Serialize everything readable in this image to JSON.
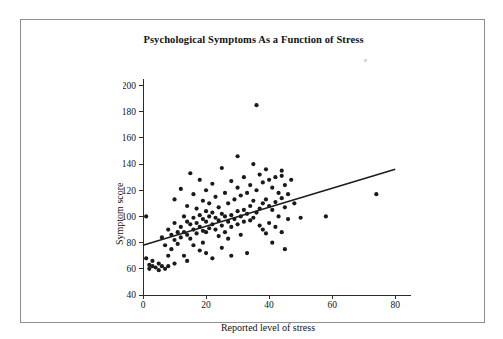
{
  "chart_data": {
    "type": "scatter",
    "title": "Psychological Symptoms As a Function of Stress",
    "xlabel": "Reported level of stress",
    "ylabel": "Symptom score",
    "xlim": [
      0,
      85
    ],
    "ylim": [
      40,
      205
    ],
    "xticks": [
      0,
      20,
      40,
      60,
      80
    ],
    "yticks": [
      40,
      60,
      80,
      100,
      120,
      140,
      160,
      180,
      200
    ],
    "xtick_labels": [
      "0",
      "20",
      "40",
      "60",
      "80"
    ],
    "ytick_labels": [
      "40",
      "60",
      "80",
      "100",
      "120",
      "140",
      "160",
      "180",
      "200"
    ],
    "grid": false,
    "legend": null,
    "marker": "filled-circle",
    "marker_color": "#1a1a1a",
    "trendline": {
      "type": "linear-regression",
      "color": "#1d1d1d",
      "x_start": 0,
      "y_start": 78,
      "x_end": 80,
      "y_end": 136
    },
    "points": [
      [
        1,
        100
      ],
      [
        1,
        68
      ],
      [
        2,
        63
      ],
      [
        2,
        60
      ],
      [
        3,
        66
      ],
      [
        3,
        62
      ],
      [
        4,
        61
      ],
      [
        5,
        64
      ],
      [
        5,
        59
      ],
      [
        6,
        62
      ],
      [
        6,
        84
      ],
      [
        7,
        78
      ],
      [
        7,
        60
      ],
      [
        8,
        90
      ],
      [
        8,
        70
      ],
      [
        8,
        62
      ],
      [
        9,
        86
      ],
      [
        9,
        75
      ],
      [
        10,
        113
      ],
      [
        10,
        95
      ],
      [
        10,
        82
      ],
      [
        10,
        64
      ],
      [
        11,
        88
      ],
      [
        11,
        79
      ],
      [
        12,
        121
      ],
      [
        12,
        92
      ],
      [
        12,
        84
      ],
      [
        13,
        100
      ],
      [
        13,
        88
      ],
      [
        13,
        70
      ],
      [
        14,
        108
      ],
      [
        14,
        96
      ],
      [
        14,
        86
      ],
      [
        14,
        66
      ],
      [
        15,
        133
      ],
      [
        15,
        94
      ],
      [
        15,
        83
      ],
      [
        16,
        117
      ],
      [
        16,
        99
      ],
      [
        16,
        90
      ],
      [
        16,
        78
      ],
      [
        17,
        106
      ],
      [
        17,
        95
      ],
      [
        17,
        87
      ],
      [
        18,
        128
      ],
      [
        18,
        101
      ],
      [
        18,
        92
      ],
      [
        18,
        74
      ],
      [
        19,
        112
      ],
      [
        19,
        98
      ],
      [
        19,
        89
      ],
      [
        19,
        80
      ],
      [
        20,
        120
      ],
      [
        20,
        104
      ],
      [
        20,
        96
      ],
      [
        20,
        88
      ],
      [
        20,
        72
      ],
      [
        21,
        110
      ],
      [
        21,
        100
      ],
      [
        21,
        91
      ],
      [
        22,
        125
      ],
      [
        22,
        103
      ],
      [
        22,
        94
      ],
      [
        22,
        68
      ],
      [
        23,
        115
      ],
      [
        23,
        99
      ],
      [
        23,
        90
      ],
      [
        24,
        107
      ],
      [
        24,
        97
      ],
      [
        24,
        85
      ],
      [
        25,
        137
      ],
      [
        25,
        102
      ],
      [
        25,
        93
      ],
      [
        25,
        76
      ],
      [
        26,
        118
      ],
      [
        26,
        100
      ],
      [
        26,
        88
      ],
      [
        27,
        110
      ],
      [
        27,
        96
      ],
      [
        27,
        83
      ],
      [
        28,
        127
      ],
      [
        28,
        101
      ],
      [
        28,
        92
      ],
      [
        28,
        70
      ],
      [
        29,
        113
      ],
      [
        29,
        98
      ],
      [
        30,
        146
      ],
      [
        30,
        122
      ],
      [
        30,
        104
      ],
      [
        30,
        94
      ],
      [
        31,
        116
      ],
      [
        31,
        100
      ],
      [
        31,
        86
      ],
      [
        32,
        130
      ],
      [
        32,
        105
      ],
      [
        32,
        96
      ],
      [
        33,
        118
      ],
      [
        33,
        102
      ],
      [
        33,
        72
      ],
      [
        34,
        124
      ],
      [
        34,
        108
      ],
      [
        34,
        97
      ],
      [
        35,
        140
      ],
      [
        35,
        112
      ],
      [
        35,
        99
      ],
      [
        36,
        185
      ],
      [
        36,
        120
      ],
      [
        36,
        103
      ],
      [
        37,
        132
      ],
      [
        37,
        106
      ],
      [
        37,
        93
      ],
      [
        38,
        126
      ],
      [
        38,
        110
      ],
      [
        38,
        90
      ],
      [
        39,
        136
      ],
      [
        39,
        113
      ],
      [
        39,
        87
      ],
      [
        40,
        128
      ],
      [
        40,
        108
      ],
      [
        40,
        95
      ],
      [
        41,
        122
      ],
      [
        41,
        105
      ],
      [
        41,
        80
      ],
      [
        42,
        130
      ],
      [
        42,
        111
      ],
      [
        42,
        92
      ],
      [
        43,
        118
      ],
      [
        43,
        100
      ],
      [
        44,
        135
      ],
      [
        44,
        131
      ],
      [
        44,
        114
      ],
      [
        44,
        88
      ],
      [
        45,
        124
      ],
      [
        45,
        107
      ],
      [
        45,
        75
      ],
      [
        46,
        117
      ],
      [
        46,
        98
      ],
      [
        47,
        128
      ],
      [
        48,
        110
      ],
      [
        50,
        99
      ],
      [
        58,
        100
      ],
      [
        74,
        117
      ]
    ]
  }
}
